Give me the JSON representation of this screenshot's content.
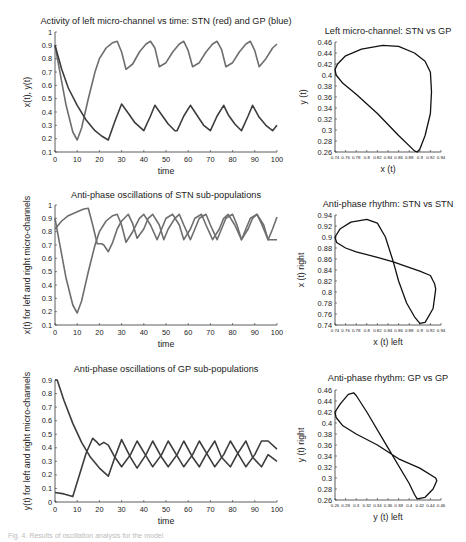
{
  "chart_data": [
    {
      "id": "p1",
      "type": "line",
      "title": "Activity of left micro-channel vs time: STN (red) and GP (blue)",
      "xlabel": "time",
      "ylabel": "x(t), y(t)",
      "xlim": [
        0,
        100
      ],
      "ylim": [
        0.1,
        1
      ],
      "xticks": [
        "0",
        "10",
        "20",
        "30",
        "40",
        "50",
        "60",
        "70",
        "80",
        "90",
        "100"
      ],
      "yticks": [
        "0.1",
        "0.2",
        "0.3",
        "0.4",
        "0.5",
        "0.6",
        "0.7",
        "0.8",
        "0.9",
        "1"
      ],
      "series": [
        {
          "name": "STN x(t)",
          "color": "#6e6e6e",
          "x": [
            0,
            2,
            5,
            8,
            10,
            12,
            15,
            18,
            20,
            23,
            26,
            28,
            30,
            32,
            35,
            38,
            41,
            43,
            45,
            47,
            50,
            53,
            56,
            58,
            60,
            62,
            65,
            68,
            71,
            73,
            75,
            77,
            80,
            83,
            86,
            88,
            90,
            92,
            95,
            98,
            100
          ],
          "y": [
            0.9,
            0.72,
            0.45,
            0.25,
            0.19,
            0.28,
            0.5,
            0.7,
            0.8,
            0.88,
            0.92,
            0.93,
            0.85,
            0.72,
            0.76,
            0.85,
            0.91,
            0.93,
            0.88,
            0.74,
            0.77,
            0.85,
            0.91,
            0.93,
            0.86,
            0.74,
            0.77,
            0.85,
            0.91,
            0.93,
            0.87,
            0.74,
            0.77,
            0.85,
            0.91,
            0.93,
            0.86,
            0.74,
            0.8,
            0.88,
            0.91
          ]
        },
        {
          "name": "GP y(t)",
          "color": "#3d3d3d",
          "x": [
            0,
            3,
            6,
            10,
            14,
            18,
            21,
            24,
            27,
            30,
            33,
            36,
            40,
            43,
            45,
            48,
            51,
            54,
            55,
            58,
            61,
            65,
            67,
            70,
            73,
            76,
            78,
            81,
            84,
            87,
            89,
            92,
            95,
            98,
            100
          ],
          "y": [
            0.9,
            0.72,
            0.58,
            0.45,
            0.34,
            0.26,
            0.22,
            0.19,
            0.33,
            0.46,
            0.39,
            0.32,
            0.26,
            0.37,
            0.45,
            0.38,
            0.31,
            0.26,
            0.26,
            0.37,
            0.45,
            0.35,
            0.3,
            0.26,
            0.37,
            0.45,
            0.38,
            0.31,
            0.26,
            0.37,
            0.45,
            0.36,
            0.3,
            0.26,
            0.3
          ]
        }
      ]
    },
    {
      "id": "p2",
      "type": "line",
      "title": "Left micro-channel: STN vs GP",
      "xlabel": "x (t)",
      "ylabel": "y (t)",
      "xlim": [
        0.74,
        0.94
      ],
      "ylim": [
        0.26,
        0.46
      ],
      "xticks": [
        "0.74",
        "0.76",
        "0.78",
        "0.8",
        "0.82",
        "0.84",
        "0.86",
        "0.88",
        "0.9",
        "0.92",
        "0.94"
      ],
      "yticks": [
        "0.26",
        "0.28",
        "0.3",
        "0.32",
        "0.34",
        "0.36",
        "0.38",
        "0.4",
        "0.42",
        "0.44",
        "0.46"
      ],
      "series": [
        {
          "name": "phase loop",
          "color": "#111111",
          "x": [
            0.74,
            0.745,
            0.76,
            0.79,
            0.83,
            0.86,
            0.89,
            0.91,
            0.92,
            0.922,
            0.92,
            0.91,
            0.9,
            0.895,
            0.89,
            0.86,
            0.82,
            0.78,
            0.755,
            0.742,
            0.74
          ],
          "y": [
            0.41,
            0.42,
            0.435,
            0.447,
            0.454,
            0.452,
            0.44,
            0.425,
            0.405,
            0.37,
            0.33,
            0.29,
            0.265,
            0.26,
            0.262,
            0.29,
            0.33,
            0.365,
            0.385,
            0.4,
            0.41
          ]
        }
      ]
    },
    {
      "id": "p3",
      "type": "line",
      "title": "Anti-phase oscillations of STN sub-populations",
      "xlabel": "time",
      "ylabel": "x(t) for left and right micro-channels",
      "xlim": [
        0,
        100
      ],
      "ylim": [
        0.1,
        1
      ],
      "xticks": [
        "0",
        "10",
        "20",
        "30",
        "40",
        "50",
        "60",
        "70",
        "80",
        "90",
        "100"
      ],
      "yticks": [
        "0.1",
        "0.2",
        "0.3",
        "0.4",
        "0.5",
        "0.6",
        "0.7",
        "0.8",
        "0.9",
        "1"
      ],
      "series": [
        {
          "name": "STN left",
          "color": "#6e6e6e",
          "x": [
            0,
            2,
            5,
            8,
            10,
            12,
            15,
            18,
            20,
            23,
            26,
            28,
            30,
            32,
            35,
            38,
            40,
            43,
            46,
            48,
            50,
            53,
            56,
            58,
            61,
            63,
            66,
            68,
            71,
            74,
            76,
            78,
            81,
            84,
            86,
            88,
            91,
            93,
            96,
            98,
            100
          ],
          "y": [
            0.9,
            0.72,
            0.45,
            0.25,
            0.19,
            0.28,
            0.5,
            0.7,
            0.8,
            0.88,
            0.92,
            0.93,
            0.85,
            0.72,
            0.8,
            0.9,
            0.93,
            0.85,
            0.74,
            0.82,
            0.9,
            0.93,
            0.85,
            0.74,
            0.82,
            0.9,
            0.93,
            0.85,
            0.74,
            0.82,
            0.9,
            0.93,
            0.85,
            0.74,
            0.82,
            0.9,
            0.93,
            0.86,
            0.74,
            0.82,
            0.91
          ]
        },
        {
          "name": "STN right",
          "color": "#6e6e6e",
          "x": [
            0,
            3,
            6,
            10,
            13,
            15,
            17,
            19,
            21,
            22,
            24,
            26,
            28,
            30,
            33,
            35,
            37,
            40,
            42,
            44,
            47,
            49,
            51,
            54,
            56,
            58,
            61,
            63,
            65,
            68,
            70,
            73,
            75,
            77,
            80,
            82,
            84,
            87,
            89,
            91,
            94,
            96,
            98,
            100
          ],
          "y": [
            0.82,
            0.88,
            0.92,
            0.95,
            0.97,
            0.975,
            0.85,
            0.71,
            0.71,
            0.7,
            0.65,
            0.72,
            0.82,
            0.88,
            0.93,
            0.86,
            0.75,
            0.82,
            0.9,
            0.93,
            0.85,
            0.74,
            0.82,
            0.9,
            0.93,
            0.85,
            0.74,
            0.82,
            0.9,
            0.93,
            0.85,
            0.74,
            0.82,
            0.9,
            0.93,
            0.85,
            0.74,
            0.82,
            0.9,
            0.93,
            0.85,
            0.74,
            0.74,
            0.74
          ]
        }
      ]
    },
    {
      "id": "p4",
      "type": "line",
      "title": "Anti-phase rhythm: STN vs STN",
      "xlabel": "x (t) left",
      "ylabel": "x (t) right",
      "xlim": [
        0.74,
        0.94
      ],
      "ylim": [
        0.74,
        0.94
      ],
      "xticks": [
        "0.74",
        "0.76",
        "0.78",
        "0.8",
        "0.82",
        "0.84",
        "0.86",
        "0.88",
        "0.9",
        "0.92",
        "0.94"
      ],
      "yticks": [
        "0.74",
        "0.76",
        "0.78",
        "0.8",
        "0.82",
        "0.84",
        "0.86",
        "0.88",
        "0.9",
        "0.92",
        "0.94"
      ],
      "series": [
        {
          "name": "figure-eight",
          "color": "#111111",
          "x": [
            0.74,
            0.75,
            0.77,
            0.8,
            0.82,
            0.835,
            0.85,
            0.86,
            0.875,
            0.89,
            0.9,
            0.91,
            0.925,
            0.93,
            0.928,
            0.92,
            0.9,
            0.87,
            0.85,
            0.82,
            0.78,
            0.76,
            0.743,
            0.74
          ],
          "y": [
            0.9,
            0.915,
            0.927,
            0.932,
            0.925,
            0.9,
            0.855,
            0.82,
            0.78,
            0.755,
            0.743,
            0.745,
            0.77,
            0.805,
            0.815,
            0.83,
            0.838,
            0.848,
            0.855,
            0.863,
            0.873,
            0.88,
            0.89,
            0.9
          ]
        }
      ]
    },
    {
      "id": "p5",
      "type": "line",
      "title": "Anti-phase oscillations of GP sub-populations",
      "xlabel": "time",
      "ylabel": "y(t) for left and right micro-channels",
      "xlim": [
        0,
        100
      ],
      "ylim": [
        0,
        0.9
      ],
      "xticks": [
        "0",
        "10",
        "20",
        "30",
        "40",
        "50",
        "60",
        "70",
        "80",
        "90",
        "100"
      ],
      "yticks": [
        "0",
        "0.1",
        "0.2",
        "0.3",
        "0.4",
        "0.5",
        "0.6",
        "0.7",
        "0.8",
        "0.9"
      ],
      "series": [
        {
          "name": "GP left",
          "color": "#3d3d3d",
          "x": [
            0,
            1,
            4,
            8,
            12,
            16,
            20,
            24,
            27,
            30,
            34,
            37,
            41,
            44,
            48,
            51,
            55,
            58,
            62,
            65,
            68,
            72,
            75,
            79,
            82,
            86,
            89,
            93,
            96,
            100
          ],
          "y": [
            0.9,
            0.9,
            0.75,
            0.58,
            0.44,
            0.33,
            0.25,
            0.19,
            0.33,
            0.46,
            0.33,
            0.25,
            0.35,
            0.45,
            0.33,
            0.26,
            0.35,
            0.45,
            0.33,
            0.26,
            0.35,
            0.45,
            0.33,
            0.26,
            0.35,
            0.45,
            0.33,
            0.26,
            0.35,
            0.3
          ]
        },
        {
          "name": "GP right",
          "color": "#3d3d3d",
          "x": [
            0,
            4,
            8,
            11,
            14,
            17,
            19,
            20,
            22,
            24,
            27,
            30,
            34,
            37,
            41,
            44,
            48,
            51,
            55,
            58,
            62,
            65,
            69,
            72,
            76,
            79,
            83,
            86,
            90,
            93,
            96,
            100
          ],
          "y": [
            0.07,
            0.06,
            0.04,
            0.2,
            0.36,
            0.47,
            0.44,
            0.42,
            0.44,
            0.42,
            0.33,
            0.26,
            0.35,
            0.45,
            0.34,
            0.26,
            0.35,
            0.45,
            0.34,
            0.26,
            0.35,
            0.45,
            0.34,
            0.26,
            0.35,
            0.45,
            0.34,
            0.26,
            0.35,
            0.45,
            0.45,
            0.39
          ]
        }
      ]
    },
    {
      "id": "p6",
      "type": "line",
      "title": "Anti-phase rhythm: GP vs GP",
      "xlabel": "y (t) left",
      "ylabel": "y (t) right",
      "xlim": [
        0.26,
        0.46
      ],
      "ylim": [
        0.26,
        0.46
      ],
      "xticks": [
        "0.26",
        "0.28",
        "0.3",
        "0.32",
        "0.34",
        "0.36",
        "0.38",
        "0.4",
        "0.42",
        "0.44",
        "0.46"
      ],
      "yticks": [
        "0.26",
        "0.28",
        "0.3",
        "0.32",
        "0.34",
        "0.36",
        "0.38",
        "0.4",
        "0.42",
        "0.44",
        "0.46"
      ],
      "series": [
        {
          "name": "figure-eight",
          "color": "#111111",
          "x": [
            0.26,
            0.27,
            0.285,
            0.295,
            0.3,
            0.32,
            0.36,
            0.4,
            0.41,
            0.415,
            0.43,
            0.445,
            0.452,
            0.45,
            0.42,
            0.38,
            0.34,
            0.3,
            0.275,
            0.262,
            0.26
          ],
          "y": [
            0.42,
            0.435,
            0.452,
            0.455,
            0.45,
            0.42,
            0.355,
            0.29,
            0.27,
            0.262,
            0.265,
            0.28,
            0.295,
            0.3,
            0.318,
            0.335,
            0.36,
            0.38,
            0.395,
            0.41,
            0.42
          ]
        }
      ]
    }
  ],
  "caption": "Fig. 4. Results of oscillation analysis for the model"
}
